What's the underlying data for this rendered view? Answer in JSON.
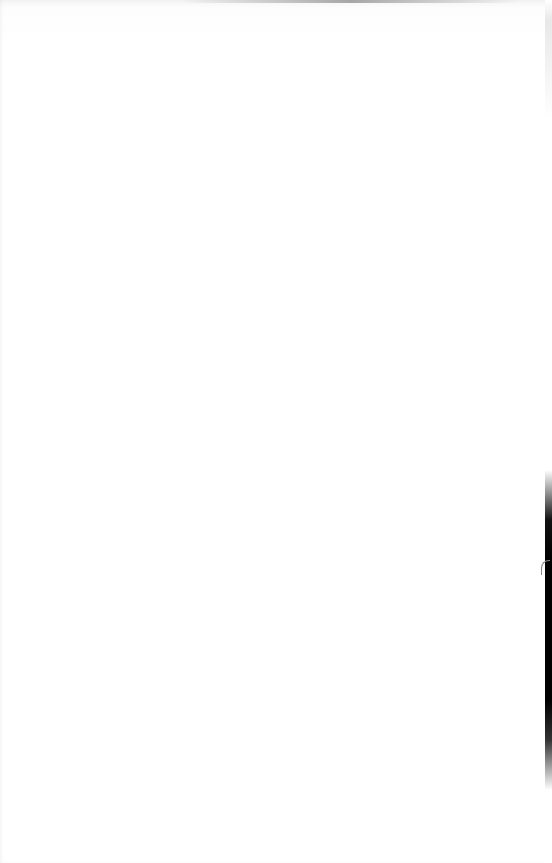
{
  "scene": {
    "description": "Blank white sheet of paper photographed close up",
    "colors": {
      "paper": "#ffffff",
      "edge": "#000000"
    }
  }
}
